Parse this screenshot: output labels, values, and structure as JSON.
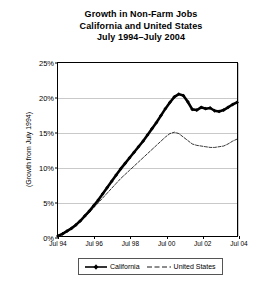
{
  "chart_data": {
    "type": "line",
    "title": "Growth in Non-Farm Jobs",
    "subtitle": "California and United States",
    "subtitle2": "July 1994–July 2004",
    "xlabel": "",
    "ylabel": "(Growth from July 1994)",
    "ylim": [
      0,
      25
    ],
    "xlim": [
      1994.5,
      2004.5
    ],
    "grid": "horizontal",
    "legend_position": "bottom-center",
    "ytick_labels": [
      "0%",
      "5%",
      "10%",
      "15%",
      "20%",
      "25%"
    ],
    "ytick_values": [
      0,
      5,
      10,
      15,
      20,
      25
    ],
    "xtick_labels": [
      "Jul 94",
      "Jul 96",
      "Jul 98",
      "Jul 00",
      "Jul 02",
      "Jul 04"
    ],
    "xtick_values": [
      1994.5,
      1996.5,
      1998.5,
      2000.5,
      2002.5,
      2004.5
    ],
    "series": [
      {
        "name": "California",
        "color": "#000000",
        "style": "solid-thick-markers",
        "x": [
          1994.5,
          1994.75,
          1995.0,
          1995.25,
          1995.5,
          1995.75,
          1996.0,
          1996.25,
          1996.5,
          1996.75,
          1997.0,
          1997.25,
          1997.5,
          1997.75,
          1998.0,
          1998.25,
          1998.5,
          1998.75,
          1999.0,
          1999.25,
          1999.5,
          1999.75,
          2000.0,
          2000.25,
          2000.5,
          2000.75,
          2001.0,
          2001.25,
          2001.5,
          2001.75,
          2002.0,
          2002.25,
          2002.5,
          2002.75,
          2003.0,
          2003.25,
          2003.5,
          2003.75,
          2004.0,
          2004.25,
          2004.5
        ],
        "values": [
          0.0,
          0.3,
          0.7,
          1.1,
          1.6,
          2.2,
          2.9,
          3.6,
          4.4,
          5.2,
          6.1,
          7.0,
          7.9,
          8.8,
          9.7,
          10.5,
          11.3,
          12.1,
          12.9,
          13.7,
          14.6,
          15.5,
          16.4,
          17.4,
          18.4,
          19.3,
          20.1,
          20.5,
          20.3,
          19.4,
          18.3,
          18.2,
          18.6,
          18.4,
          18.5,
          18.1,
          18.0,
          18.2,
          18.6,
          19.0,
          19.3
        ]
      },
      {
        "name": "United States",
        "color": "#000000",
        "style": "dashed-thin",
        "x": [
          1994.5,
          1994.75,
          1995.0,
          1995.25,
          1995.5,
          1995.75,
          1996.0,
          1996.25,
          1996.5,
          1996.75,
          1997.0,
          1997.25,
          1997.5,
          1997.75,
          1998.0,
          1998.25,
          1998.5,
          1998.75,
          1999.0,
          1999.25,
          1999.5,
          1999.75,
          2000.0,
          2000.25,
          2000.5,
          2000.75,
          2001.0,
          2001.25,
          2001.5,
          2001.75,
          2002.0,
          2002.25,
          2002.5,
          2002.75,
          2003.0,
          2003.25,
          2003.5,
          2003.75,
          2004.0,
          2004.25,
          2004.5
        ],
        "values": [
          0.0,
          0.4,
          0.8,
          1.2,
          1.7,
          2.2,
          2.8,
          3.4,
          4.1,
          4.8,
          5.5,
          6.2,
          6.9,
          7.6,
          8.3,
          8.9,
          9.5,
          10.1,
          10.7,
          11.3,
          11.9,
          12.5,
          13.1,
          13.7,
          14.3,
          14.8,
          15.0,
          14.8,
          14.3,
          13.8,
          13.3,
          13.1,
          13.0,
          12.9,
          12.8,
          12.8,
          12.9,
          13.0,
          13.3,
          13.7,
          14.0
        ]
      }
    ]
  },
  "legend": {
    "items": [
      {
        "label": "California"
      },
      {
        "label": "United States"
      }
    ]
  }
}
